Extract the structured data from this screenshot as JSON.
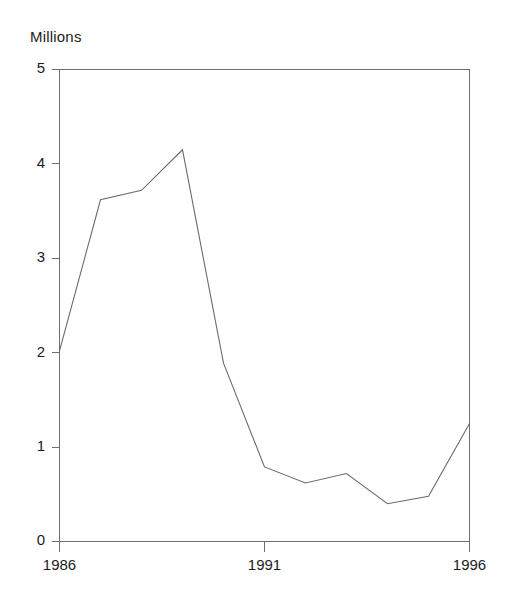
{
  "chart_data": {
    "type": "line",
    "title": "",
    "ylabel": "Millions",
    "xlabel": "",
    "categories": [
      "1986",
      "1987",
      "1988",
      "1989",
      "1990",
      "1991",
      "1992",
      "1993",
      "1994",
      "1995",
      "1996"
    ],
    "x": [
      1986,
      1987,
      1988,
      1989,
      1990,
      1991,
      1992,
      1993,
      1994,
      1995,
      1996
    ],
    "values": [
      2.02,
      3.62,
      3.72,
      4.15,
      1.89,
      0.79,
      0.62,
      0.72,
      0.4,
      0.48,
      1.25
    ],
    "series": [
      {
        "name": "Millions",
        "values": [
          2.02,
          3.62,
          3.72,
          4.15,
          1.89,
          0.79,
          0.62,
          0.72,
          0.4,
          0.48,
          1.25
        ]
      }
    ],
    "xlim": [
      1986,
      1996
    ],
    "ylim": [
      0,
      5
    ],
    "ytick_labels": [
      "0",
      "1",
      "2",
      "3",
      "4",
      "5"
    ],
    "ytick_values": [
      0,
      1,
      2,
      3,
      4,
      5
    ],
    "xtick_labels": [
      "1986",
      "1991",
      "1996"
    ],
    "xtick_values": [
      1986,
      1991,
      1996
    ],
    "grid": false,
    "legend": false,
    "legend_position": "none",
    "line_color": "#6b6b6b",
    "axis_color": "#6e6e6e",
    "background_color": "#ffffff",
    "annotations": []
  },
  "labels": {
    "y_axis_unit": "Millions",
    "y_0": "0",
    "y_1": "1",
    "y_2": "2",
    "y_3": "3",
    "y_4": "4",
    "y_5": "5",
    "x_start": "1986",
    "x_mid": "1991",
    "x_end": "1996"
  }
}
